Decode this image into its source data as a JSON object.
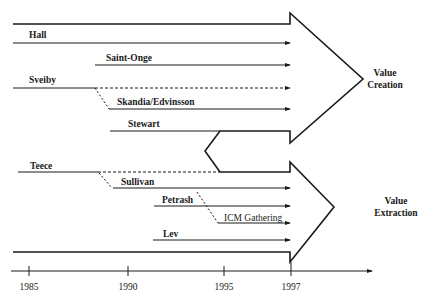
{
  "diagram": {
    "type": "timeline-arrows",
    "colors": {
      "stroke": "#1a1a1a",
      "background": "#ffffff"
    },
    "upper_arrow": {
      "outcome": [
        "Value",
        "Creation"
      ],
      "contributors": [
        {
          "name": "Hall"
        },
        {
          "name": "Saint-Onge"
        },
        {
          "name": "Sveiby"
        },
        {
          "name": "Skandia/Edvinsson"
        },
        {
          "name": "Stewart"
        }
      ]
    },
    "lower_arrow": {
      "outcome": [
        "Value",
        "Extraction"
      ],
      "contributors": [
        {
          "name": "Teece"
        },
        {
          "name": "Sullivan"
        },
        {
          "name": "Petrash"
        },
        {
          "name": "ICM Gathering"
        },
        {
          "name": "Lev"
        }
      ]
    },
    "axis": {
      "ticks": [
        "1985",
        "1990",
        "1995",
        "1997"
      ]
    }
  }
}
